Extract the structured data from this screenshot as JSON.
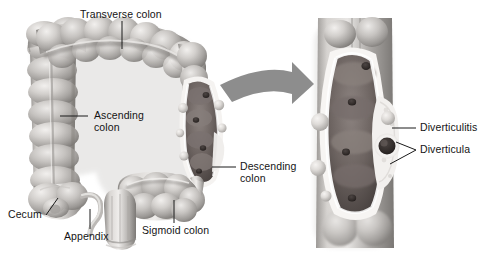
{
  "figure": {
    "type": "medical-anatomical-illustration",
    "rendering": "grayscale shaded airbrush",
    "background_color": "#ffffff",
    "text_color": "#141414",
    "leader_line_color": "#1a1a1a",
    "panels": [
      {
        "name": "main-colon-overview",
        "description": "Large intestine showing cecum, appendix, ascending, transverse, descending and sigmoid colon with a diseased descending segment"
      },
      {
        "name": "magnified-inset",
        "description": "Cut-away magnification of the descending colon wall showing inflamed diverticula"
      }
    ],
    "arrow": {
      "name": "magnification-arrow",
      "color": "#8d8d8d",
      "direction": "curved-right"
    }
  },
  "labels": {
    "transverse_colon": "Transverse colon",
    "ascending_colon": "Ascending\ncolon",
    "cecum": "Cecum",
    "appendix": "Appendix",
    "sigmoid_colon": "Sigmoid colon",
    "descending_colon": "Descending\ncolon",
    "diverticulitis": "Diverticulitis",
    "diverticula": "Diverticula"
  },
  "colors": {
    "colon_light": "#e8e6e4",
    "colon_mid": "#b9b6b3",
    "colon_shadow": "#8a8784",
    "colon_dark": "#5e5b58",
    "lumen_dark": "#6b6360",
    "lumen_darkest": "#3a3331",
    "inflamed_rim": "#f4f2f0",
    "arrow_gray": "#8d8d8d"
  }
}
